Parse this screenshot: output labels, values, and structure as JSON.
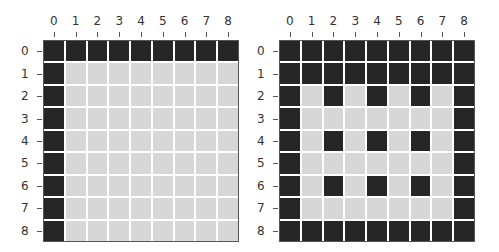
{
  "chart_data": [
    {
      "type": "heatmap",
      "title": "",
      "xlabel": "",
      "ylabel": "",
      "x_ticks": [
        "0",
        "1",
        "2",
        "3",
        "4",
        "5",
        "6",
        "7",
        "8"
      ],
      "y_ticks": [
        "0",
        "1",
        "2",
        "3",
        "4",
        "5",
        "6",
        "7",
        "8"
      ],
      "x_axis_position": "top",
      "colors": {
        "dark": "#262626",
        "light": "#d7d7d7"
      },
      "legend": [],
      "grid": [
        [
          1,
          1,
          1,
          1,
          1,
          1,
          1,
          1,
          1
        ],
        [
          1,
          0,
          0,
          0,
          0,
          0,
          0,
          0,
          0
        ],
        [
          1,
          0,
          0,
          0,
          0,
          0,
          0,
          0,
          0
        ],
        [
          1,
          0,
          0,
          0,
          0,
          0,
          0,
          0,
          0
        ],
        [
          1,
          0,
          0,
          0,
          0,
          0,
          0,
          0,
          0
        ],
        [
          1,
          0,
          0,
          0,
          0,
          0,
          0,
          0,
          0
        ],
        [
          1,
          0,
          0,
          0,
          0,
          0,
          0,
          0,
          0
        ],
        [
          1,
          0,
          0,
          0,
          0,
          0,
          0,
          0,
          0
        ],
        [
          1,
          0,
          0,
          0,
          0,
          0,
          0,
          0,
          0
        ]
      ]
    },
    {
      "type": "heatmap",
      "title": "",
      "xlabel": "",
      "ylabel": "",
      "x_ticks": [
        "0",
        "1",
        "2",
        "3",
        "4",
        "5",
        "6",
        "7",
        "8"
      ],
      "y_ticks": [
        "0",
        "1",
        "2",
        "3",
        "4",
        "5",
        "6",
        "7",
        "8"
      ],
      "x_axis_position": "top",
      "colors": {
        "dark": "#262626",
        "light": "#d7d7d7"
      },
      "legend": [],
      "grid": [
        [
          1,
          1,
          1,
          1,
          1,
          1,
          1,
          1,
          1
        ],
        [
          1,
          1,
          1,
          1,
          1,
          1,
          1,
          1,
          1
        ],
        [
          1,
          0,
          1,
          0,
          1,
          0,
          1,
          0,
          1
        ],
        [
          1,
          0,
          0,
          0,
          0,
          0,
          0,
          0,
          1
        ],
        [
          1,
          0,
          1,
          0,
          1,
          0,
          1,
          0,
          1
        ],
        [
          1,
          0,
          0,
          0,
          0,
          0,
          0,
          0,
          1
        ],
        [
          1,
          0,
          1,
          0,
          1,
          0,
          1,
          0,
          1
        ],
        [
          1,
          0,
          0,
          0,
          0,
          0,
          0,
          0,
          1
        ],
        [
          1,
          1,
          1,
          1,
          1,
          1,
          1,
          1,
          1
        ]
      ]
    }
  ]
}
